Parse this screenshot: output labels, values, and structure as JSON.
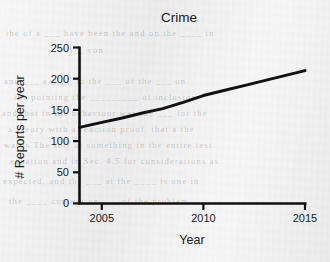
{
  "chart_data": {
    "type": "line",
    "title": "Crime",
    "xlabel": "Year",
    "ylabel": "# Reports per year",
    "xlim": [
      2003.9,
      2015.0
    ],
    "ylim": [
      0,
      250
    ],
    "xticks": [
      "2005",
      "2010",
      "2015"
    ],
    "xtick_values": [
      2005,
      2010,
      2015
    ],
    "yticks": [
      "0",
      "50",
      "100",
      "150",
      "200",
      "250"
    ],
    "ytick_values": [
      0,
      50,
      100,
      150,
      200,
      250
    ],
    "grid": false,
    "legend": "none",
    "series": [
      {
        "name": "Reports per year",
        "color": "#111111",
        "x": [
          2003.9,
          2005,
          2006,
          2007,
          2008,
          2009,
          2010,
          2011,
          2012,
          2013,
          2014,
          2015
        ],
        "values": [
          122,
          130,
          137,
          145,
          152,
          162,
          173,
          181,
          189,
          197,
          205,
          213
        ]
      }
    ]
  },
  "axes": {
    "title": "Crime",
    "x_axis_label": "Year",
    "y_axis_label": "# Reports per year",
    "x_tick_labels": [
      "2005",
      "2010",
      "2015"
    ],
    "y_tick_labels": [
      "250",
      "200",
      "150",
      "100",
      "50",
      "0"
    ]
  },
  "background": {
    "paper_color": "#f0f0f0",
    "ink_color": "#111111",
    "ghost_text": [
      "the of a ___ have been the and on the ____ in",
      "=  )__                    von",
      "and ___  a ____ to the ___  of the ___ on",
      "the pointing the _________ of inclusion",
      "and that in the  behaviour  was the ___ for the",
      "a theory with a reaction  proof.   that  a  the",
      "wards  The self of something in the entire  test",
      "equation  and  in  Sec. 4.5 for  considerations  as",
      "expected,  and  the ___ at  the  ____ is  one  in",
      "the  ____  context  on  ___ of  the  problem"
    ]
  }
}
